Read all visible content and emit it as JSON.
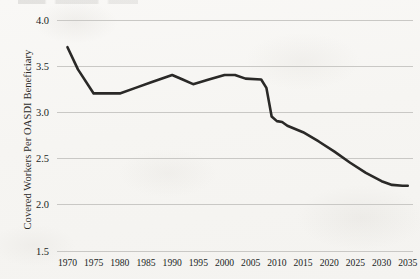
{
  "chart_data": {
    "type": "line",
    "title": "",
    "xlabel": "",
    "ylabel": "Covered Workers Per OASDI Beneficiary",
    "xlim": [
      1968,
      2036
    ],
    "ylim": [
      1.5,
      4.0
    ],
    "grid": true,
    "legend": null,
    "xticks": [
      1970,
      1975,
      1980,
      1985,
      1990,
      1995,
      2000,
      2005,
      2010,
      2015,
      2020,
      2025,
      2030,
      2035
    ],
    "yticks": [
      "1.5",
      "2.0",
      "2.5",
      "3.0",
      "3.5",
      "4.0"
    ],
    "series": [
      {
        "name": "Covered Workers Per OASDI Beneficiary",
        "color": "#2a2927",
        "x": [
          1970,
          1972,
          1975,
          1977,
          1980,
          1983,
          1986,
          1990,
          1992,
          1994,
          1997,
          2000,
          2002,
          2004,
          2007,
          2008,
          2009,
          2010,
          2011,
          2012,
          2015,
          2018,
          2021,
          2024,
          2027,
          2030,
          2032,
          2034,
          2035
        ],
        "values": [
          3.7,
          3.46,
          3.2,
          3.2,
          3.2,
          3.26,
          3.32,
          3.4,
          3.35,
          3.3,
          3.35,
          3.4,
          3.4,
          3.36,
          3.35,
          3.26,
          2.95,
          2.9,
          2.89,
          2.85,
          2.78,
          2.68,
          2.57,
          2.45,
          2.34,
          2.25,
          2.21,
          2.2,
          2.2
        ]
      }
    ]
  },
  "axes": {
    "y_title": "Covered Workers Per OASDI Beneficiary"
  }
}
